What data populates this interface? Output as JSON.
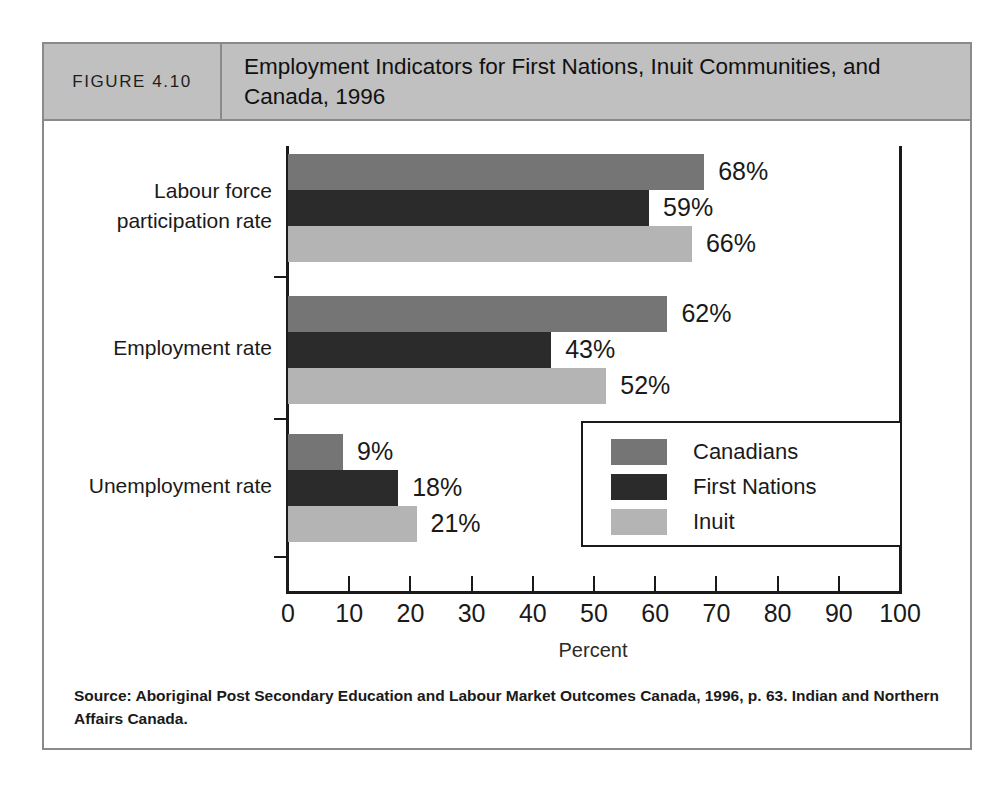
{
  "figure": {
    "number_label": "FIGURE 4.10",
    "title": "Employment Indicators for First Nations, Inuit Communities, and Canada, 1996",
    "source": "Source: Aboriginal Post Secondary Education and Labour Market Outcomes Canada, 1996, p. 63. Indian and Northern Affairs Canada."
  },
  "colors": {
    "canadians": "#757575",
    "first_nations": "#2b2b2b",
    "inuit": "#b4b4b4",
    "header_band": "#c0c0c0",
    "frame_border": "#8a8a8a",
    "axis": "#1a1a1a",
    "page_background": "#ffffff"
  },
  "legend": {
    "position": "inside-lower-right",
    "entries": [
      {
        "label": "Canadians",
        "color": "#757575"
      },
      {
        "label": "First Nations",
        "color": "#2b2b2b"
      },
      {
        "label": "Inuit",
        "color": "#b4b4b4"
      }
    ]
  },
  "axis": {
    "x_title": "Percent",
    "x_ticks": [
      "0",
      "10",
      "20",
      "30",
      "40",
      "50",
      "60",
      "70",
      "80",
      "90",
      "100"
    ]
  },
  "chart_data": {
    "type": "bar",
    "orientation": "horizontal",
    "title": "Employment Indicators for First Nations, Inuit Communities, and Canada, 1996",
    "xlabel": "Percent",
    "ylabel": "",
    "xlim": [
      0,
      100
    ],
    "xticks": [
      0,
      10,
      20,
      30,
      40,
      50,
      60,
      70,
      80,
      90,
      100
    ],
    "grid": false,
    "legend_position": "inside-lower-right",
    "categories": [
      "Labour force participation rate",
      "Employment rate",
      "Unemployment rate"
    ],
    "category_lines": [
      [
        "Labour force",
        "participation rate"
      ],
      [
        "Employment rate"
      ],
      [
        "Unemployment rate"
      ]
    ],
    "series": [
      {
        "name": "Canadians",
        "color": "#757575",
        "values": [
          68,
          62,
          9
        ],
        "labels": [
          "68%",
          "62%",
          "9%"
        ]
      },
      {
        "name": "First Nations",
        "color": "#2b2b2b",
        "values": [
          59,
          43,
          18
        ],
        "labels": [
          "59%",
          "43%",
          "18%"
        ]
      },
      {
        "name": "Inuit",
        "color": "#b4b4b4",
        "values": [
          66,
          52,
          21
        ],
        "labels": [
          "66%",
          "52%",
          "21%"
        ]
      }
    ]
  }
}
